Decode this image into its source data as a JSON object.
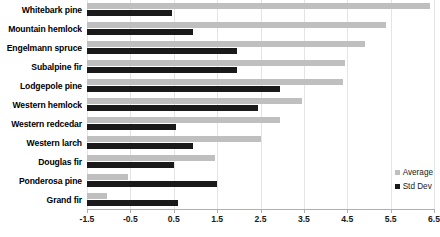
{
  "chart_data": {
    "type": "bar",
    "orientation": "horizontal",
    "title": "",
    "xlabel": "",
    "ylabel": "",
    "xlim": [
      -1.5,
      6.5
    ],
    "xticks": [
      -1.5,
      -0.5,
      0.5,
      1.5,
      2.5,
      3.5,
      4.5,
      5.5,
      6.5
    ],
    "xtick_labels": [
      "-1.5",
      "-0.5",
      "0.5",
      "1.5",
      "2.5",
      "3.5",
      "4.5",
      "5.5",
      "6.5"
    ],
    "grid": true,
    "grid_axis": "x",
    "legend_position": "lower-right",
    "categories": [
      "Whitebark pine",
      "Mountain hemlock",
      "Engelmann spruce",
      "Subalpine fir",
      "Lodgepole pine",
      "Western hemlock",
      "Western redcedar",
      "Western larch",
      "Douglas fir",
      "Ponderosa pine",
      "Grand fir"
    ],
    "series": [
      {
        "name": "Average",
        "color": "#bfbfbf",
        "values": [
          6.4,
          5.4,
          4.9,
          4.45,
          4.4,
          3.45,
          2.95,
          2.5,
          1.45,
          -0.55,
          -1.05
        ]
      },
      {
        "name": "Std Dev",
        "color": "#1a1a1a",
        "values": [
          0.45,
          0.95,
          1.95,
          1.95,
          2.95,
          2.45,
          0.55,
          0.95,
          0.5,
          1.5,
          0.6
        ]
      }
    ]
  },
  "legend": {
    "items": [
      {
        "label": "Average",
        "color": "#bfbfbf"
      },
      {
        "label": "Std Dev",
        "color": "#1a1a1a"
      }
    ]
  }
}
